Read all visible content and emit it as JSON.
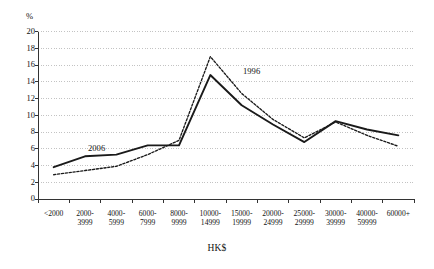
{
  "chart_data": {
    "type": "line",
    "title": "",
    "subtitle": "",
    "xlabel": "HK$",
    "ylabel": "%",
    "ylim": [
      0,
      20
    ],
    "ytick_step": 2,
    "yticks": [
      0,
      2,
      4,
      6,
      8,
      10,
      12,
      14,
      16,
      18,
      20
    ],
    "grid": true,
    "grid_style": "dotted horizontal",
    "legend_position": "inline annotations on plot",
    "categories": [
      "<2000",
      "2000-3999",
      "4000-5999",
      "6000-7999",
      "8000-9999",
      "10000-14999",
      "15000-19999",
      "20000-24999",
      "25000-29999",
      "30000-39999",
      "40000-59999",
      "60000+"
    ],
    "category_lines": [
      [
        "<2000",
        ""
      ],
      [
        "2000-",
        "3999"
      ],
      [
        "4000-",
        "5999"
      ],
      [
        "6000-",
        "7999"
      ],
      [
        "8000-",
        "9999"
      ],
      [
        "10000-",
        "14999"
      ],
      [
        "15000-",
        "19999"
      ],
      [
        "20000-",
        "24999"
      ],
      [
        "25000-",
        "29999"
      ],
      [
        "30000-",
        "39999"
      ],
      [
        "40000-",
        "59999"
      ],
      [
        "60000+",
        ""
      ]
    ],
    "series": [
      {
        "name": "1996",
        "style": "dotted",
        "color": "#1a1a1a",
        "values": [
          2.9,
          3.4,
          3.9,
          5.3,
          7.0,
          17.0,
          12.6,
          9.5,
          7.3,
          9.2,
          7.6,
          6.3
        ]
      },
      {
        "name": "2006",
        "style": "solid",
        "color": "#1a1a1a",
        "values": [
          3.8,
          5.1,
          5.3,
          6.4,
          6.4,
          14.8,
          11.2,
          8.9,
          6.8,
          9.3,
          8.3,
          7.6
        ]
      }
    ],
    "annotations": [
      {
        "text": "1996",
        "series": "1996"
      },
      {
        "text": "2006",
        "series": "2006"
      }
    ]
  },
  "axes": {
    "y_unit": "%",
    "x_unit": "HK$"
  }
}
